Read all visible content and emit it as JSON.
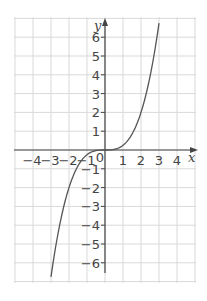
{
  "chart_data": {
    "type": "line",
    "title": "",
    "xlabel": "x",
    "ylabel": "y",
    "xlim": [
      -5,
      5
    ],
    "ylim": [
      -7,
      7
    ],
    "grid": true,
    "x_ticks": [
      -4,
      -3,
      -2,
      -1,
      0,
      1,
      2,
      3,
      4
    ],
    "y_ticks": [
      -6,
      -5,
      -4,
      -3,
      -2,
      -1,
      1,
      2,
      3,
      4,
      5,
      6
    ],
    "x_tick_labels": [
      "−4",
      "−3",
      "−2",
      "−1",
      "0",
      "1",
      "2",
      "3",
      "4"
    ],
    "y_tick_labels": [
      "−6",
      "−5",
      "−4",
      "−3",
      "−2",
      "−1",
      "1",
      "2",
      "3",
      "4",
      "5",
      "6"
    ],
    "series": [
      {
        "name": "y = 0.25x^3 (cubic)",
        "x": [
          -3.3,
          -3.0,
          -2.5,
          -2.0,
          -1.5,
          -1.0,
          -0.5,
          0,
          0.5,
          1.0,
          1.5,
          2.0,
          2.5,
          3.0,
          3.3
        ],
        "y": [
          -9.0,
          -6.75,
          -3.9,
          -2.0,
          -0.84,
          -0.25,
          -0.03,
          0,
          0.03,
          0.25,
          0.84,
          2.0,
          3.9,
          6.75,
          9.0
        ]
      }
    ],
    "colors": {
      "grid": "#d9d9d9",
      "axis": "#444444",
      "curve": "#555555"
    }
  }
}
